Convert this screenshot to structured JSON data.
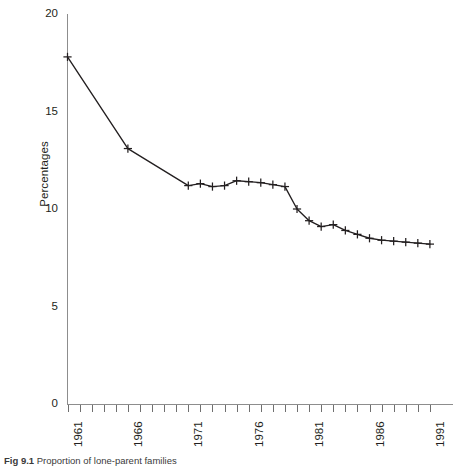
{
  "figure": {
    "caption_label": "Fig 9.1",
    "caption_text": "Proportion of lone-parent families"
  },
  "axes": {
    "y_title": "Percentages",
    "y_ticks": [
      "0",
      "5",
      "10",
      "15",
      "20"
    ],
    "x_ticks_labeled": [
      "1961",
      "1966",
      "1971",
      "1976",
      "1981",
      "1986",
      "1991"
    ]
  },
  "chart_data": {
    "type": "line",
    "title": "",
    "xlabel": "",
    "ylabel": "Percentages",
    "xlim": [
      1960,
      1992
    ],
    "ylim": [
      0,
      20
    ],
    "grid": false,
    "legend": "none",
    "marker": "plus",
    "line_color": "#231f20",
    "x_tick_interval": 1,
    "x_tick_label_interval": 5,
    "y_tick_interval": 5,
    "x": [
      1961,
      1966,
      1971,
      1972,
      1973,
      1974,
      1975,
      1976,
      1977,
      1978,
      1979,
      1980,
      1981,
      1982,
      1983,
      1984,
      1985,
      1986,
      1987,
      1988,
      1989,
      1990,
      1991
    ],
    "values": [
      17.8,
      13.1,
      11.2,
      11.3,
      11.15,
      11.2,
      11.45,
      11.4,
      11.35,
      11.25,
      11.15,
      10.0,
      9.4,
      9.1,
      9.2,
      8.9,
      8.7,
      8.5,
      8.4,
      8.35,
      8.3,
      8.25,
      8.2
    ],
    "series": [
      {
        "name": "Percentages",
        "values": [
          17.8,
          13.1,
          11.2,
          11.3,
          11.15,
          11.2,
          11.45,
          11.4,
          11.35,
          11.25,
          11.15,
          10.0,
          9.4,
          9.1,
          9.2,
          8.9,
          8.7,
          8.5,
          8.4,
          8.35,
          8.3,
          8.25,
          8.2
        ]
      }
    ]
  }
}
